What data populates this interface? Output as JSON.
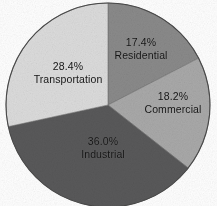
{
  "chart_data": {
    "type": "pie",
    "title": "",
    "subtitle": "",
    "xlabel": "",
    "ylabel": "",
    "legend": "none",
    "grid": false,
    "units": "percent",
    "start_angle_deg": 0,
    "direction": "clockwise",
    "labels_inside": true,
    "categories": [
      "Residential",
      "Commercial",
      "Industrial",
      "Transportation"
    ],
    "values": [
      17.4,
      18.2,
      36.0,
      28.4
    ],
    "slices": [
      {
        "name": "Residential",
        "value": 17.4,
        "value_label": "17.4%",
        "color": "#8a8a8a",
        "start_deg": 0.0,
        "end_deg": 62.64
      },
      {
        "name": "Commercial",
        "value": 18.2,
        "value_label": "18.2%",
        "color": "#a9a9a9",
        "start_deg": 62.64,
        "end_deg": 128.16
      },
      {
        "name": "Industrial",
        "value": 36.0,
        "value_label": "36.0%",
        "color": "#59595a",
        "start_deg": 128.16,
        "end_deg": 257.76
      },
      {
        "name": "Transportation",
        "value": 28.4,
        "value_label": "28.4%",
        "color": "#dcdcdc",
        "start_deg": 257.76,
        "end_deg": 360.0
      }
    ]
  },
  "figure": {
    "background_color": "#ffffff",
    "outline_color": "#4a4a4a",
    "label_text_color": "#141414"
  }
}
